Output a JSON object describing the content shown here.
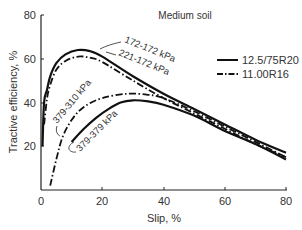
{
  "chart_data": {
    "type": "line",
    "title": "Medium soil",
    "xlabel": "Slip, %",
    "ylabel": "Tractive efficiency, %",
    "xlim": [
      0,
      80
    ],
    "ylim": [
      0,
      80
    ],
    "xticks": [
      0,
      20,
      40,
      60,
      80
    ],
    "yticks": [
      20,
      40,
      60,
      80
    ],
    "grid": false,
    "legend_position": "upper right",
    "legend": [
      {
        "label": "12.5/75R20",
        "style": "solid"
      },
      {
        "label": "11.00R16",
        "style": "dash-dot"
      }
    ],
    "series": [
      {
        "name": "172-172 kPa",
        "tire": "12.5/75R20",
        "style": "solid",
        "x": [
          0.5,
          1,
          2,
          3,
          5,
          8,
          12,
          16,
          20,
          30,
          40,
          50,
          60,
          70,
          80
        ],
        "y": [
          20,
          40,
          46,
          52,
          58,
          62,
          64,
          63.5,
          61,
          52,
          44,
          37,
          30,
          23,
          17
        ]
      },
      {
        "name": "221-172 kPa",
        "tire": "11.00R16",
        "style": "dash-dot",
        "x": [
          1,
          2,
          3,
          5,
          8,
          12,
          16,
          20,
          30,
          40,
          50,
          60,
          70,
          80
        ],
        "y": [
          30,
          42,
          48,
          55,
          59,
          61,
          60.5,
          58.5,
          50,
          42,
          35,
          28,
          21,
          15
        ]
      },
      {
        "name": "379-310 kPa",
        "tire": "11.00R16",
        "style": "dash-dot",
        "x": [
          3,
          5,
          7,
          10,
          14,
          20,
          28,
          35,
          40,
          50,
          60,
          70,
          80
        ],
        "y": [
          2,
          14,
          24,
          32,
          38,
          42,
          44,
          43.5,
          42,
          36,
          29,
          22,
          15
        ]
      },
      {
        "name": "379-379 kPa",
        "tire": "12.5/75R20",
        "style": "solid",
        "x": [
          10,
          14,
          18,
          22,
          26,
          30,
          35,
          40,
          50,
          60,
          70,
          80
        ],
        "y": [
          22,
          28,
          33,
          37,
          40,
          41,
          40.5,
          39,
          34,
          27,
          21,
          14
        ]
      }
    ],
    "annotations": [
      "172-172 kPa",
      "221-172 kPa",
      "379-310 kPa",
      "379-379 kPa"
    ]
  },
  "labels": {
    "title": "Medium soil",
    "xlabel": "Slip, %",
    "ylabel": "Tractive efficiency, %",
    "legend_solid": "12.5/75R20",
    "legend_dashdot": "11.00R16",
    "xtick_0": "0",
    "xtick_1": "20",
    "xtick_2": "40",
    "xtick_3": "60",
    "xtick_4": "80",
    "ytick_0": "20",
    "ytick_1": "40",
    "ytick_2": "60",
    "ytick_3": "80",
    "ann_172": "172-172 kPa",
    "ann_221": "221-172 kPa",
    "ann_310": "379-310 kPa",
    "ann_379": "379-379 kPa"
  }
}
